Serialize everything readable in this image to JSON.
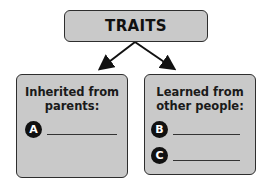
{
  "diagram": {
    "root": {
      "label": "TRAITS"
    },
    "branches": [
      {
        "header": "Inherited from parents:",
        "header_lines": [
          "Inherited from",
          "parents:"
        ],
        "blanks": [
          {
            "label": "A",
            "value": ""
          }
        ]
      },
      {
        "header": "Learned from other people:",
        "header_lines": [
          "Learned from",
          "other people:"
        ],
        "blanks": [
          {
            "label": "B",
            "value": ""
          },
          {
            "label": "C",
            "value": ""
          }
        ]
      }
    ],
    "colors": {
      "box_fill": "#c9c9c9",
      "border": "#2e2e2e",
      "badge": "#111111",
      "arrow": "#111111"
    }
  }
}
